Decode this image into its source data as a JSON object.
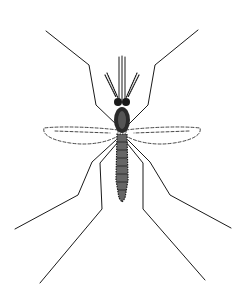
{
  "image": {
    "subject": "mosquito",
    "style": "black-and-white line drawing",
    "background": "#ffffff",
    "ink": "#111111"
  }
}
